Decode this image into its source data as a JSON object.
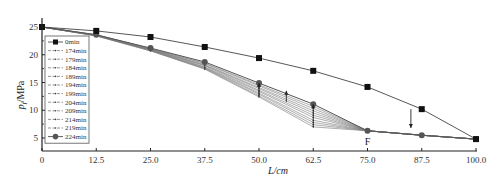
{
  "chart_data": {
    "type": "line",
    "title": "",
    "xlabel": "L/cm",
    "ylabel": "p_f/MPa",
    "xlim": [
      0,
      100
    ],
    "ylim": [
      2.8,
      27
    ],
    "grid": false,
    "legend_position": "upper-left inside",
    "x": [
      0,
      12.5,
      25.0,
      37.5,
      50.0,
      62.5,
      75.0,
      87.5,
      100.0
    ],
    "x_tick_labels": [
      "0",
      "12.5",
      "25.0",
      "37.5",
      "50.0",
      "62.5",
      "75.0",
      "87.5",
      "100.0"
    ],
    "y_ticks": [
      5,
      10,
      15,
      20,
      25
    ],
    "y_tick_labels": [
      "5",
      "10",
      "15",
      "20",
      "25"
    ],
    "series": [
      {
        "name": "0min",
        "marker": "square",
        "values": [
          25.0,
          24.3,
          23.2,
          21.4,
          19.4,
          17.1,
          14.2,
          10.2,
          4.8
        ]
      },
      {
        "name": "174min",
        "marker": "small-dot",
        "values": [
          25.0,
          23.4,
          20.7,
          17.4,
          12.4,
          7.0,
          6.3,
          5.5,
          4.8
        ]
      },
      {
        "name": "179min",
        "marker": "small-dot",
        "values": [
          25.0,
          23.4,
          20.7,
          17.5,
          12.6,
          7.4,
          6.3,
          5.5,
          4.8
        ]
      },
      {
        "name": "184min",
        "marker": "small-dot",
        "values": [
          25.0,
          23.4,
          20.8,
          17.6,
          12.9,
          7.8,
          6.3,
          5.5,
          4.8
        ]
      },
      {
        "name": "189min",
        "marker": "small-dot",
        "values": [
          25.0,
          23.5,
          20.8,
          17.7,
          13.1,
          8.2,
          6.3,
          5.5,
          4.8
        ]
      },
      {
        "name": "194min",
        "marker": "small-dot",
        "values": [
          25.0,
          23.5,
          20.9,
          17.8,
          13.4,
          8.7,
          6.3,
          5.5,
          4.8
        ]
      },
      {
        "name": "199min",
        "marker": "small-dot",
        "values": [
          25.0,
          23.5,
          20.9,
          18.0,
          13.6,
          9.1,
          6.3,
          5.5,
          4.8
        ]
      },
      {
        "name": "204min",
        "marker": "small-dot",
        "values": [
          25.0,
          23.5,
          21.0,
          18.1,
          13.9,
          9.5,
          6.3,
          5.5,
          4.8
        ]
      },
      {
        "name": "209min",
        "marker": "small-dot",
        "values": [
          25.0,
          23.5,
          21.0,
          18.2,
          14.1,
          9.9,
          6.3,
          5.5,
          4.8
        ]
      },
      {
        "name": "214min",
        "marker": "small-dot",
        "values": [
          25.0,
          23.6,
          21.1,
          18.4,
          14.4,
          10.3,
          6.3,
          5.5,
          4.8
        ]
      },
      {
        "name": "219min",
        "marker": "small-dot",
        "values": [
          25.0,
          23.6,
          21.1,
          18.5,
          14.6,
          10.7,
          6.3,
          5.5,
          4.8
        ]
      },
      {
        "name": "224min",
        "marker": "circle",
        "values": [
          25.0,
          23.6,
          21.2,
          18.7,
          14.9,
          11.1,
          6.3,
          5.5,
          4.8
        ]
      }
    ],
    "annotations": [
      {
        "text": "F",
        "x": 75.0,
        "y": 6.3,
        "position": "below point"
      },
      {
        "type": "arrow-up",
        "x": 50.0,
        "from": 12.4,
        "to": 14.9
      },
      {
        "type": "arrow-up",
        "x": 56.3,
        "from": 11.5,
        "to": 13.5
      },
      {
        "type": "arrow-up",
        "x": 62.5,
        "from": 7.0,
        "to": 11.1
      },
      {
        "type": "arrow-down",
        "x": 85.0,
        "from": 10.2,
        "to": 6.8
      }
    ]
  },
  "labels": {
    "x_axis_title": "L/cm",
    "y_axis_title_main": "p",
    "y_axis_title_sub": "f",
    "y_axis_title_unit": "/MPa",
    "f_label": "F"
  }
}
